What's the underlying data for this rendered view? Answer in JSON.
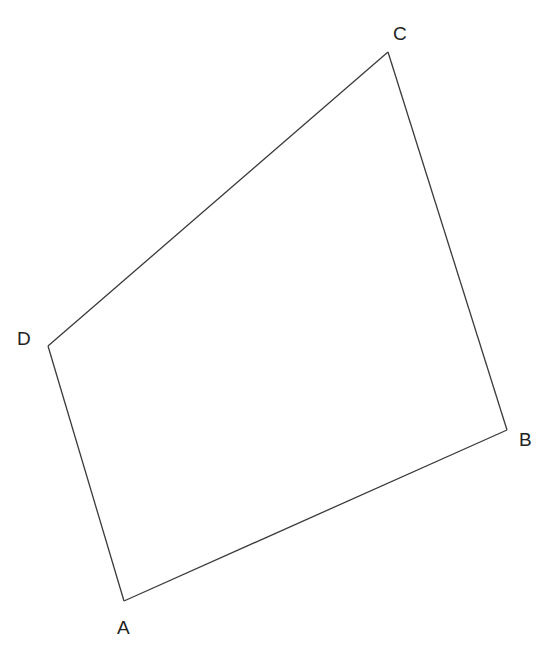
{
  "diagram": {
    "type": "quadrilateral",
    "stroke_color": "#3a3a3a",
    "label_color": "#222222",
    "vertices": [
      {
        "name": "A",
        "x": 124,
        "y": 601,
        "label_x": 117,
        "label_y": 634
      },
      {
        "name": "B",
        "x": 507,
        "y": 430,
        "label_x": 519,
        "label_y": 446
      },
      {
        "name": "C",
        "x": 388,
        "y": 52,
        "label_x": 393,
        "label_y": 40
      },
      {
        "name": "D",
        "x": 48,
        "y": 346,
        "label_x": 17,
        "label_y": 345
      }
    ],
    "edges": [
      [
        "A",
        "B"
      ],
      [
        "B",
        "C"
      ],
      [
        "C",
        "D"
      ],
      [
        "D",
        "A"
      ]
    ],
    "labels": {
      "A": "A",
      "B": "B",
      "C": "C",
      "D": "D"
    }
  }
}
